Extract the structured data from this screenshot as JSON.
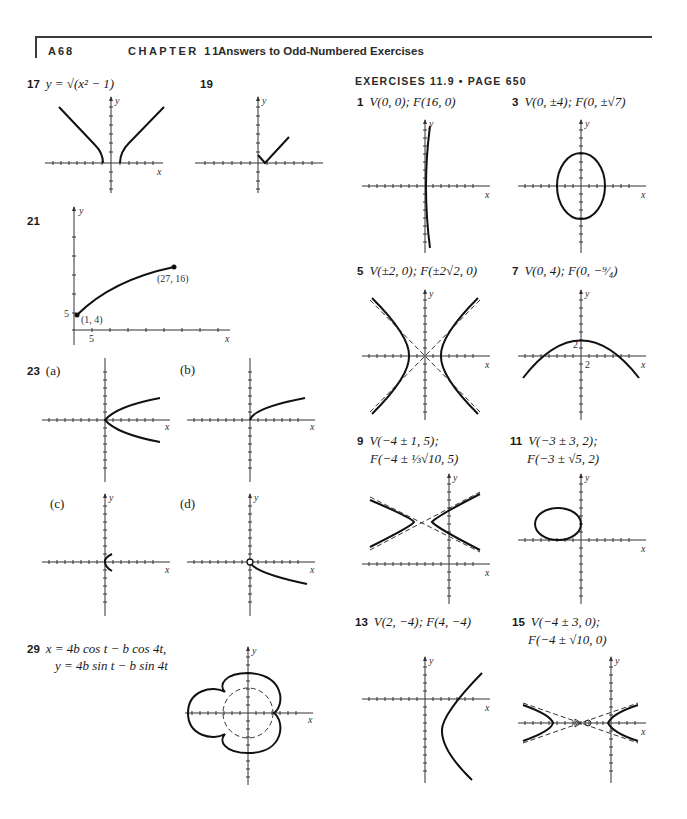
{
  "header": {
    "page_number": "A68",
    "chapter": "CHAPTER 11",
    "title": "Answers to Odd-Numbered Exercises"
  },
  "left_column": {
    "ex17": {
      "number": "17",
      "text": "y = √(x² − 1)"
    },
    "ex19": {
      "number": "19",
      "text": ""
    },
    "ex21": {
      "number": "21",
      "points": [
        "(1, 4)",
        "(27, 16)"
      ],
      "y_tick": "5",
      "x_tick": "5"
    },
    "ex23": {
      "number": "23",
      "parts": [
        "(a)",
        "(b)",
        "(c)",
        "(d)"
      ]
    },
    "ex29": {
      "number": "29",
      "line1": "x = 4b cos t − b cos 4t,",
      "line2": "y = 4b sin t − b sin 4t"
    }
  },
  "right_column": {
    "section_title": "EXERCISES 11.9 • PAGE 650",
    "ex1": {
      "number": "1",
      "text": "V(0, 0); F(16, 0)"
    },
    "ex3": {
      "number": "3",
      "text": "V(0, ±4); F(0, ±√7)"
    },
    "ex5": {
      "number": "5",
      "text": "V(±2, 0); F(±2√2, 0)"
    },
    "ex7": {
      "number": "7",
      "text": "V(0, 4); F(0, −⁹⁄₄)",
      "tick_label_y": "2",
      "tick_label_x": "2"
    },
    "ex9": {
      "number": "9",
      "line1": "V(−4 ± 1, 5);",
      "line2": "F(−4 ± ⅓√10, 5)"
    },
    "ex11": {
      "number": "11",
      "line1": "V(−3 ± 3, 2);",
      "line2": "F(−3 ± √5, 2)"
    },
    "ex13": {
      "number": "13",
      "text": "V(2, −4); F(4, −4)"
    },
    "ex15": {
      "number": "15",
      "line1": "V(−4 ± 3, 0);",
      "line2": "F(−4 ± √10, 0)"
    }
  },
  "axis_labels": {
    "x": "x",
    "y": "y"
  }
}
